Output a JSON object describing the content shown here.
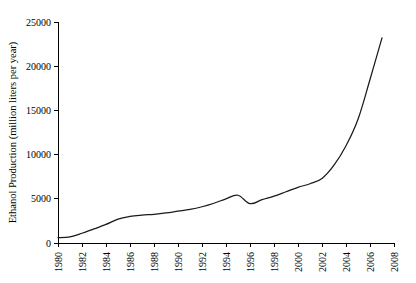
{
  "chart_data": {
    "type": "line",
    "title": "",
    "subtitle": "",
    "xlabel": "",
    "ylabel": "Ethanol Production (million liters per year)",
    "xlim": [
      1980,
      2008
    ],
    "ylim": [
      0,
      25000
    ],
    "grid": false,
    "legend": null,
    "legend_position": "none",
    "x_tick_labels": [
      "1980",
      "1982",
      "1984",
      "1986",
      "1988",
      "1990",
      "1992",
      "1994",
      "1996",
      "1998",
      "2000",
      "2002",
      "2004",
      "2006",
      "2008"
    ],
    "x_tick_values": [
      1980,
      1982,
      1984,
      1986,
      1988,
      1990,
      1992,
      1994,
      1996,
      1998,
      2000,
      2002,
      2004,
      2006,
      2008
    ],
    "y_tick_labels": [
      "0",
      "5000",
      "10000",
      "15000",
      "20000",
      "25000"
    ],
    "y_tick_values": [
      0,
      5000,
      10000,
      15000,
      20000,
      25000
    ],
    "series": [
      {
        "name": "Ethanol Production",
        "color": "#1a1a1a",
        "x": [
          1980,
          1981,
          1982,
          1983,
          1984,
          1985,
          1986,
          1987,
          1988,
          1989,
          1990,
          1991,
          1992,
          1993,
          1994,
          1995,
          1996,
          1997,
          1998,
          1999,
          2000,
          2001,
          2002,
          2003,
          2004,
          2005,
          2006,
          2007
        ],
        "values": [
          600,
          700,
          1100,
          1600,
          2100,
          2700,
          3000,
          3150,
          3250,
          3400,
          3600,
          3800,
          4100,
          4500,
          5000,
          5400,
          4450,
          4900,
          5300,
          5800,
          6300,
          6700,
          7300,
          8800,
          11000,
          14000,
          18500,
          23200
        ]
      }
    ]
  },
  "axes": {
    "y_axis_name": "y-axis",
    "x_axis_name": "x-axis"
  }
}
